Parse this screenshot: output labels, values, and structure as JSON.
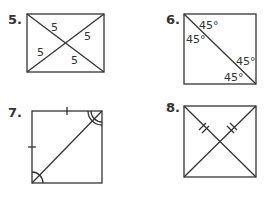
{
  "figures": [
    {
      "number": "5.",
      "shape": "rectangle with both diagonals",
      "labels": [
        "5",
        "5",
        "5",
        "5"
      ]
    },
    {
      "number": "6.",
      "shape": "square with one diagonal",
      "labels": [
        "45°",
        "45°",
        "45°",
        "45°"
      ]
    },
    {
      "number": "7.",
      "shape": "square with one diagonal, congruent side ticks and angle arcs",
      "labels": []
    },
    {
      "number": "8.",
      "shape": "square with both diagonals, double tick marks on half-diagonals",
      "labels": []
    }
  ],
  "colors": {
    "ink": "#333333",
    "background": "#ffffff"
  }
}
